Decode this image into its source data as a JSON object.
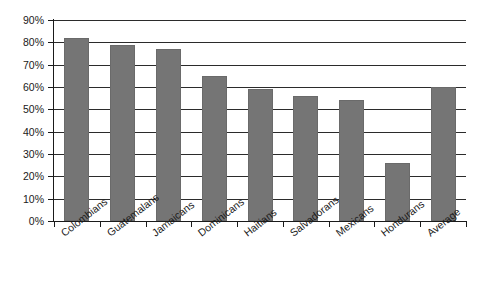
{
  "chart_data": {
    "type": "bar",
    "title": "",
    "subtitle": "",
    "xlabel": "",
    "ylabel": "",
    "categories": [
      "Colombians",
      "Guatemalans",
      "Jamaicans",
      "Dominicans",
      "Haitians",
      "Salvadorans",
      "Mexicans",
      "Hondurans",
      "Average"
    ],
    "values": [
      82,
      79,
      77,
      65,
      59,
      56,
      54,
      26,
      60
    ],
    "ylim": [
      0,
      90
    ],
    "ytick_values": [
      0,
      10,
      20,
      30,
      40,
      50,
      60,
      70,
      80,
      90
    ],
    "ytick_labels": [
      "0%",
      "10%",
      "20%",
      "30%",
      "40%",
      "50%",
      "60%",
      "70%",
      "80%",
      "90%"
    ],
    "grid": "horizontal",
    "legend": "none",
    "bar_color": "#757575",
    "axis_color": "#1a1a1a",
    "background_color": "#ffffff",
    "annotations": []
  }
}
